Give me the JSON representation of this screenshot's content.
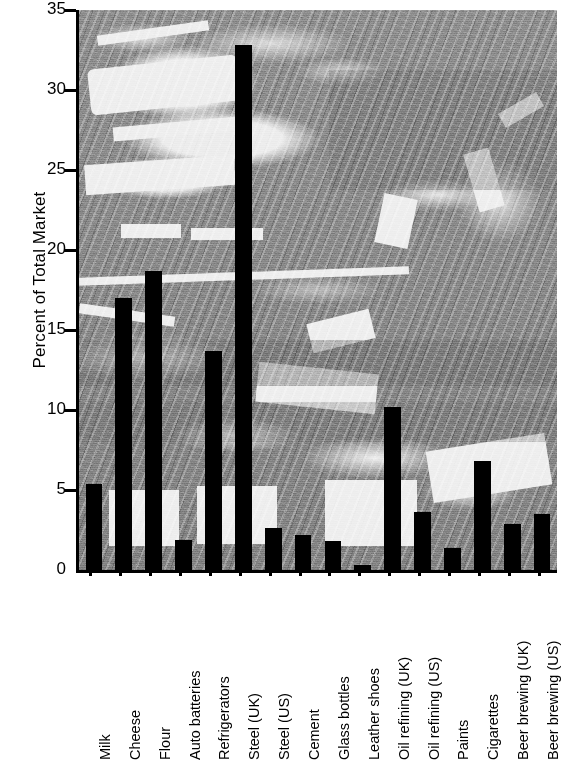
{
  "chart_data": {
    "type": "bar",
    "title": "",
    "xlabel": "",
    "ylabel": "Percent of Total Market",
    "ylim": [
      0,
      35
    ],
    "ytick_values": [
      0,
      5,
      10,
      15,
      20,
      25,
      30,
      35
    ],
    "ytick_labels": [
      "0",
      "5",
      "10",
      "15",
      "20",
      "25",
      "30",
      "35"
    ],
    "grid": false,
    "legend": null,
    "bar_color": "#000000",
    "plot_background": "photograph-factory-assembly-line",
    "categories": [
      "Milk",
      "Cheese",
      "Flour",
      "Auto batteries",
      "Refrigerators",
      "Steel (UK)",
      "Steel (US)",
      "Cement",
      "Glass bottles",
      "Leather shoes",
      "Oil refining (UK)",
      "Oil refining (US)",
      "Paints",
      "Cigarettes",
      "Beer brewing (UK)",
      "Beer brewing (US)"
    ],
    "values": [
      5.4,
      17.0,
      18.7,
      1.9,
      13.7,
      32.8,
      2.6,
      2.2,
      1.8,
      0.3,
      10.2,
      3.6,
      1.4,
      6.8,
      2.9,
      3.5
    ]
  }
}
